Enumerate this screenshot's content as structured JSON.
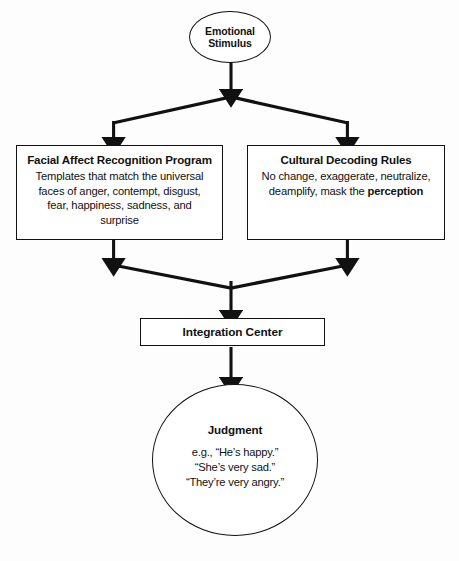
{
  "diagram": {
    "background_color": "#fdfdfd",
    "line_color": "#111111",
    "node_fill_color": "#ffffff"
  },
  "nodes": {
    "emotional_stimulus": {
      "shape": "ellipse",
      "title": "Emotional\nStimulus",
      "line1": "Emotional",
      "line2": "Stimulus"
    },
    "facial_affect": {
      "shape": "rectangle",
      "title": "Facial Affect Recognition Program",
      "body": "Templates that match the universal faces of anger, contempt, disgust, fear, happiness, sadness, and surprise"
    },
    "cultural_decoding": {
      "shape": "rectangle",
      "title": "Cultural Decoding Rules",
      "body_part1": "No change, exaggerate, neutralize, deamplify, mask the ",
      "body_emphasis": "perception"
    },
    "integration_center": {
      "shape": "rectangle",
      "title": "Integration Center"
    },
    "judgment": {
      "shape": "circle",
      "title": "Judgment",
      "example_1": "e.g., “He’s happy.”",
      "example_2": "“She’s very sad.”",
      "example_3": "“They’re very angry.”"
    }
  },
  "connectors": [
    {
      "name": "stimulus-to-split",
      "from": "emotional_stimulus",
      "to": "split-apex",
      "style": "arrow-down"
    },
    {
      "name": "split-to-facial-affect",
      "from": "split-apex",
      "to": "facial_affect",
      "style": "chevron-left-arrow-down"
    },
    {
      "name": "split-to-cultural-decoding",
      "from": "split-apex",
      "to": "cultural_decoding",
      "style": "chevron-right-arrow-down"
    },
    {
      "name": "facial-affect-to-merge",
      "from": "facial_affect",
      "to": "merge-apex",
      "style": "arrow-down-then-v"
    },
    {
      "name": "cultural-decoding-to-merge",
      "from": "cultural_decoding",
      "to": "merge-apex",
      "style": "arrow-down-then-v"
    },
    {
      "name": "merge-to-integration-center",
      "from": "merge-apex",
      "to": "integration_center",
      "style": "arrow-down"
    },
    {
      "name": "integration-center-to-judgment",
      "from": "integration_center",
      "to": "judgment",
      "style": "arrow-down"
    }
  ]
}
